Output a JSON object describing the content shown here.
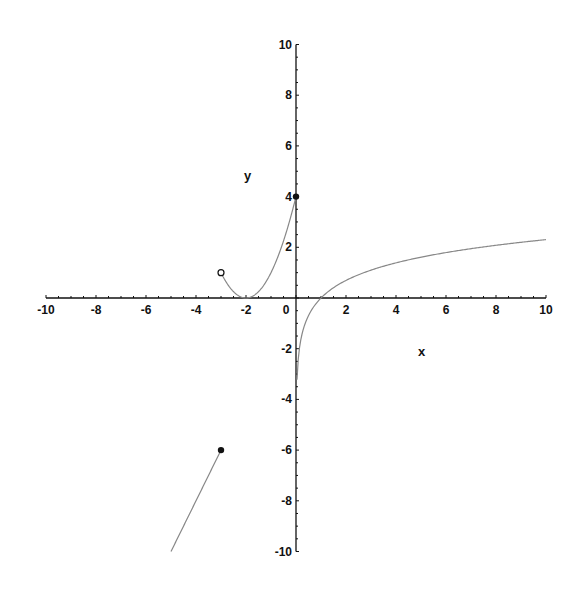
{
  "chart_data": {
    "type": "line",
    "title": "",
    "xlabel": "x",
    "ylabel": "y",
    "xlim": [
      -10,
      10
    ],
    "ylim": [
      -10,
      10
    ],
    "grid": false,
    "legend": null,
    "x_ticks": [
      -10,
      -8,
      -6,
      -4,
      -2,
      0,
      2,
      4,
      6,
      8,
      10
    ],
    "y_ticks": [
      -10,
      -8,
      -6,
      -4,
      -2,
      2,
      4,
      6,
      8,
      10
    ],
    "series": [
      {
        "name": "y = 2x",
        "domain": [
          -5,
          -3
        ],
        "points": [
          [
            -5,
            -10
          ],
          [
            -3,
            -6
          ]
        ],
        "end_markers": [
          {
            "x": -3,
            "y": -6,
            "type": "closed"
          }
        ]
      },
      {
        "name": "y = (x+2)^2",
        "domain": [
          -3,
          0
        ],
        "points": [
          [
            -3,
            1
          ],
          [
            -2.5,
            0.25
          ],
          [
            -2,
            0
          ],
          [
            -1.5,
            0.25
          ],
          [
            -1,
            1
          ],
          [
            -0.5,
            2.25
          ],
          [
            0,
            4
          ]
        ],
        "end_markers": [
          {
            "x": -3,
            "y": 1,
            "type": "open"
          },
          {
            "x": 0,
            "y": 4,
            "type": "closed"
          }
        ]
      },
      {
        "name": "y = ln(x)",
        "domain": [
          0.04,
          10
        ],
        "points": [
          [
            0.04,
            -3.22
          ],
          [
            0.1,
            -2.3
          ],
          [
            0.5,
            -0.69
          ],
          [
            1,
            0
          ],
          [
            2,
            0.69
          ],
          [
            4,
            1.39
          ],
          [
            6,
            1.79
          ],
          [
            8,
            2.08
          ],
          [
            10,
            2.3
          ]
        ],
        "end_markers": []
      }
    ],
    "colors": {
      "curve": "#888888",
      "axis": "#111111",
      "marker": "#111111"
    }
  }
}
